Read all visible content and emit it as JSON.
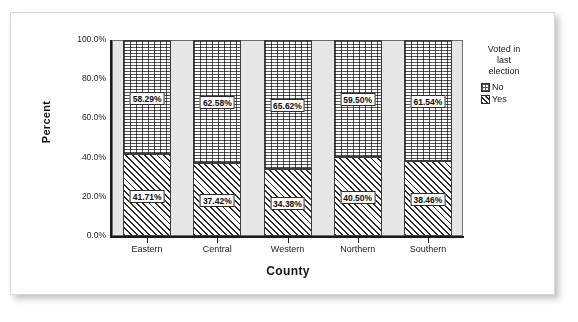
{
  "chart_data": {
    "type": "bar",
    "stacked": true,
    "title": "",
    "xlabel": "County",
    "ylabel": "Percent",
    "categories": [
      "Eastern",
      "Central",
      "Western",
      "Northern",
      "Southern"
    ],
    "ylim": [
      0,
      100
    ],
    "ytick_labels": [
      "100.0%",
      "80.0%",
      "60.0%",
      "40.0%",
      "20.0%",
      "0.0%"
    ],
    "ytick_values": [
      100,
      80,
      60,
      40,
      20,
      0
    ],
    "grid": false,
    "legend_position": "right",
    "legend_title": "Voted in last election",
    "series": [
      {
        "name": "No",
        "fill": "dotted",
        "values": [
          58.29,
          62.58,
          65.62,
          59.5,
          61.54
        ],
        "data_labels": [
          "58.29%",
          "62.58%",
          "65.62%",
          "59.50%",
          "61.54%"
        ]
      },
      {
        "name": "Yes",
        "fill": "diagonal-hatch",
        "values": [
          41.71,
          37.42,
          34.38,
          40.5,
          38.46
        ],
        "data_labels": [
          "41.71%",
          "37.42%",
          "34.38%",
          "40.50%",
          "38.46%"
        ]
      }
    ]
  },
  "axis": {
    "ylabel": "Percent",
    "xlabel": "County"
  },
  "legend": {
    "title_lines": [
      "Voted in",
      "last",
      "election"
    ],
    "title": "Voted in last election",
    "items": [
      {
        "label": "No",
        "swatch": "dotted-swatch"
      },
      {
        "label": "Yes",
        "swatch": "hatched-swatch"
      }
    ]
  },
  "colors": {
    "plot_background": "#e6e6e6",
    "page_background": "#ffffff",
    "axis": "#1a1a1a",
    "bar_outline": "#3c3c3c"
  }
}
